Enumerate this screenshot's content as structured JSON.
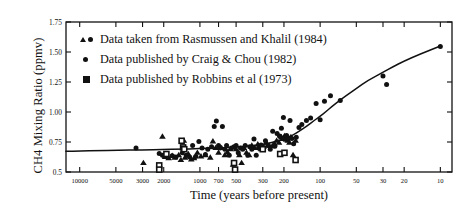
{
  "chart_data": {
    "type": "scatter",
    "title": "",
    "xlabel": "Time (years before present)",
    "ylabel": "CH4 Mixing Ratio (ppmv)",
    "xscale": "log-reversed",
    "xlim": [
      13000,
      8
    ],
    "ylim": [
      0.5,
      1.75
    ],
    "grid": false,
    "legend_position": "top-left",
    "xticks": [
      10000,
      5000,
      3000,
      2000,
      1000,
      700,
      500,
      300,
      200,
      100,
      50,
      30,
      20,
      10
    ],
    "xtick_labels": [
      "10000",
      "5000",
      "3000",
      "2000",
      "1000",
      "700",
      "500",
      "300",
      "200",
      "100",
      "50",
      "30",
      "20",
      "10"
    ],
    "yticks": [
      0.5,
      0.75,
      1.0,
      1.25,
      1.5,
      1.75
    ],
    "ytick_labels": [
      "0.5",
      "0.75",
      "1.00",
      "1.25",
      "1.50",
      "1.75"
    ],
    "series": [
      {
        "name": "Data taken from Rasmussen and Khalil (1984)",
        "marker": "triangle",
        "color": "#111111",
        "points": [
          [
            2950,
            0.575
          ],
          [
            2050,
            0.795
          ],
          [
            1950,
            0.625
          ],
          [
            1820,
            0.615
          ],
          [
            1700,
            0.635
          ],
          [
            1620,
            0.62
          ],
          [
            1500,
            0.64
          ],
          [
            1440,
            0.6
          ],
          [
            1360,
            0.76
          ],
          [
            1330,
            0.62
          ],
          [
            1250,
            0.65
          ],
          [
            1180,
            0.605
          ],
          [
            1120,
            0.615
          ],
          [
            1050,
            0.66
          ],
          [
            980,
            0.63
          ],
          [
            900,
            0.64
          ],
          [
            820,
            0.62
          ],
          [
            780,
            0.755
          ],
          [
            740,
            0.7
          ],
          [
            700,
            0.66
          ],
          [
            660,
            0.7
          ],
          [
            620,
            0.64
          ],
          [
            590,
            0.665
          ],
          [
            560,
            0.69
          ],
          [
            530,
            0.56
          ],
          [
            500,
            0.69
          ],
          [
            470,
            0.64
          ],
          [
            450,
            0.575
          ],
          [
            430,
            0.7
          ],
          [
            410,
            0.66
          ],
          [
            390,
            0.64
          ],
          [
            370,
            0.72
          ],
          [
            350,
            0.7
          ],
          [
            330,
            0.73
          ],
          [
            310,
            0.69
          ],
          [
            295,
            0.71
          ],
          [
            280,
            0.745
          ],
          [
            265,
            0.72
          ],
          [
            250,
            0.715
          ],
          [
            240,
            0.735
          ],
          [
            230,
            0.76
          ],
          [
            220,
            0.745
          ],
          [
            210,
            0.79
          ],
          [
            205,
            0.775
          ],
          [
            198,
            0.8
          ],
          [
            192,
            0.77
          ],
          [
            186,
            0.76
          ],
          [
            180,
            0.745
          ],
          [
            175,
            0.79
          ],
          [
            168,
            0.64
          ],
          [
            160,
            0.76
          ]
        ]
      },
      {
        "name": "Data published by Craig & Chou (1982)",
        "marker": "circle",
        "color": "#111111",
        "points": [
          [
            3400,
            0.7
          ],
          [
            2180,
            0.655
          ],
          [
            2050,
            0.64
          ],
          [
            1980,
            0.635
          ],
          [
            1900,
            0.65
          ],
          [
            1700,
            0.635
          ],
          [
            1580,
            0.625
          ],
          [
            1400,
            0.66
          ],
          [
            1300,
            0.64
          ],
          [
            1220,
            0.625
          ],
          [
            1150,
            0.72
          ],
          [
            1080,
            0.63
          ],
          [
            1020,
            0.755
          ],
          [
            960,
            0.7
          ],
          [
            900,
            0.645
          ],
          [
            860,
            0.69
          ],
          [
            800,
            0.71
          ],
          [
            760,
            0.88
          ],
          [
            730,
            0.925
          ],
          [
            700,
            0.72
          ],
          [
            680,
            0.7
          ],
          [
            650,
            0.88
          ],
          [
            620,
            0.69
          ],
          [
            600,
            0.72
          ],
          [
            570,
            0.64
          ],
          [
            545,
            0.7
          ],
          [
            520,
            0.71
          ],
          [
            500,
            0.72
          ],
          [
            480,
            0.66
          ],
          [
            460,
            0.7
          ],
          [
            440,
            0.69
          ],
          [
            420,
            0.72
          ],
          [
            400,
            0.64
          ],
          [
            385,
            0.71
          ],
          [
            370,
            0.69
          ],
          [
            355,
            0.775
          ],
          [
            340,
            0.64
          ],
          [
            325,
            0.7
          ],
          [
            310,
            0.725
          ],
          [
            298,
            0.69
          ],
          [
            285,
            0.76
          ],
          [
            272,
            0.72
          ],
          [
            260,
            0.69
          ],
          [
            248,
            0.84
          ],
          [
            238,
            0.715
          ],
          [
            228,
            0.82
          ],
          [
            218,
            0.8
          ],
          [
            210,
            0.865
          ],
          [
            202,
            0.955
          ],
          [
            196,
            0.79
          ],
          [
            190,
            0.805
          ],
          [
            184,
            0.78
          ],
          [
            178,
            0.93
          ],
          [
            172,
            0.78
          ],
          [
            166,
            0.735
          ],
          [
            158,
            0.79
          ],
          [
            150,
            0.87
          ],
          [
            142,
            0.895
          ],
          [
            130,
            0.93
          ],
          [
            120,
            0.95
          ],
          [
            108,
            1.07
          ],
          [
            100,
            0.935
          ],
          [
            92,
            1.09
          ],
          [
            82,
            1.135
          ],
          [
            68,
            1.095
          ],
          [
            30,
            1.3
          ],
          [
            28,
            1.23
          ],
          [
            10,
            1.545
          ]
        ]
      },
      {
        "name": "Data published by Robbins et al (1973)",
        "marker": "square",
        "color": "#111111",
        "points": [
          [
            2180,
            0.555
          ],
          [
            2180,
            0.52
          ],
          [
            1900,
            0.65
          ],
          [
            1420,
            0.76
          ],
          [
            1380,
            0.705
          ],
          [
            1350,
            0.69
          ],
          [
            520,
            0.575
          ],
          [
            510,
            0.52
          ],
          [
            300,
            0.69
          ],
          [
            215,
            0.65
          ],
          [
            198,
            0.66
          ],
          [
            160,
            0.6
          ]
        ]
      }
    ],
    "trend_curve": {
      "name": "fitted trend line",
      "color": "#111111",
      "points": [
        [
          13000,
          0.672
        ],
        [
          10000,
          0.675
        ],
        [
          7000,
          0.678
        ],
        [
          5000,
          0.681
        ],
        [
          3000,
          0.684
        ],
        [
          2000,
          0.688
        ],
        [
          1500,
          0.69
        ],
        [
          1000,
          0.694
        ],
        [
          700,
          0.7
        ],
        [
          500,
          0.708
        ],
        [
          400,
          0.716
        ],
        [
          300,
          0.73
        ],
        [
          250,
          0.745
        ],
        [
          200,
          0.775
        ],
        [
          170,
          0.805
        ],
        [
          150,
          0.838
        ],
        [
          130,
          0.88
        ],
        [
          110,
          0.935
        ],
        [
          100,
          0.965
        ],
        [
          90,
          1.0
        ],
        [
          80,
          1.045
        ],
        [
          70,
          1.09
        ],
        [
          60,
          1.14
        ],
        [
          50,
          1.195
        ],
        [
          40,
          1.265
        ],
        [
          30,
          1.33
        ],
        [
          25,
          1.375
        ],
        [
          20,
          1.425
        ],
        [
          15,
          1.48
        ],
        [
          10,
          1.55
        ]
      ]
    }
  },
  "legend": {
    "items": [
      {
        "label": "Data taken from Rasmussen and Khalil (1984)",
        "markers": "triangle+circle"
      },
      {
        "label": "Data published by Craig & Chou (1982)",
        "markers": "circle"
      },
      {
        "label": "Data published by Robbins et al (1973)",
        "markers": "square"
      }
    ]
  },
  "axes": {
    "y_title": "CH4 Mixing Ratio (ppmv)",
    "x_title": "Time (years before present)"
  }
}
